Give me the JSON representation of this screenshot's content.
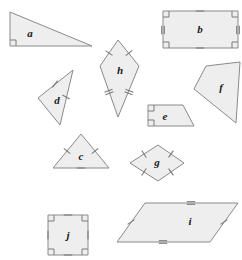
{
  "figure": {
    "width": 242,
    "height": 260,
    "background_color": "#ffffff",
    "shape_fill_color": "#eeeeee",
    "shape_stroke_color": "#8a8a8a",
    "mark_color": "#7a7a7a",
    "label_color": "#1a1a1a"
  },
  "shapes": [
    {
      "id": "a",
      "label": "a",
      "kind": "right-triangle",
      "points": "10,12 10,46 92,46",
      "label_x": 30,
      "label_y": 34,
      "right_angles": [
        {
          "x": 10,
          "y": 46,
          "dx": 1,
          "dy": -1
        }
      ],
      "ticks": []
    },
    {
      "id": "b",
      "label": "b",
      "kind": "rectangle",
      "points": "163,11 238,11 238,48 163,48",
      "label_x": 200,
      "label_y": 30,
      "right_angles": [
        {
          "x": 163,
          "y": 11,
          "dx": 1,
          "dy": 1
        },
        {
          "x": 238,
          "y": 11,
          "dx": -1,
          "dy": 1
        },
        {
          "x": 238,
          "y": 48,
          "dx": -1,
          "dy": -1
        },
        {
          "x": 163,
          "y": 48,
          "dx": 1,
          "dy": -1
        }
      ],
      "ticks": [
        {
          "x": 200,
          "y": 11,
          "angle": 90,
          "count": 1
        },
        {
          "x": 200,
          "y": 48,
          "angle": 90,
          "count": 1
        },
        {
          "x": 163,
          "y": 30,
          "angle": 0,
          "count": 2
        },
        {
          "x": 238,
          "y": 30,
          "angle": 0,
          "count": 2
        }
      ]
    },
    {
      "id": "c",
      "label": "c",
      "kind": "equilateral-triangle",
      "points": "81,134 109,168 53,168",
      "label_x": 81,
      "label_y": 157,
      "right_angles": [],
      "ticks": [
        {
          "x": 95,
          "y": 151,
          "angle": 50,
          "count": 1
        },
        {
          "x": 67,
          "y": 151,
          "angle": -50,
          "count": 1
        },
        {
          "x": 81,
          "y": 168,
          "angle": 90,
          "count": 1
        }
      ]
    },
    {
      "id": "d",
      "label": "d",
      "kind": "isosceles-triangle",
      "points": "73,70 38,98 60,125",
      "label_x": 57,
      "label_y": 101,
      "right_angles": [],
      "ticks": [
        {
          "x": 55,
          "y": 84,
          "angle": 38,
          "count": 1
        },
        {
          "x": 66,
          "y": 97,
          "angle": -60,
          "count": 1
        }
      ]
    },
    {
      "id": "e",
      "label": "e",
      "kind": "right-trapezoid",
      "points": "148,105 183,105 194,126 148,126",
      "label_x": 165,
      "label_y": 117,
      "right_angles": [
        {
          "x": 148,
          "y": 105,
          "dx": 1,
          "dy": 1
        },
        {
          "x": 148,
          "y": 126,
          "dx": 1,
          "dy": -1
        }
      ],
      "ticks": []
    },
    {
      "id": "f",
      "label": "f",
      "kind": "irregular-quadrilateral",
      "points": "206,66 240,62 236,123 194,89",
      "label_x": 221,
      "label_y": 88,
      "right_angles": [],
      "ticks": []
    },
    {
      "id": "g",
      "label": "g",
      "kind": "rhombus",
      "points": "158,145 184,163 158,181 130,163",
      "label_x": 157,
      "label_y": 163,
      "right_angles": [],
      "ticks": [
        {
          "x": 171,
          "y": 154,
          "angle": 35,
          "count": 1
        },
        {
          "x": 171,
          "y": 172,
          "angle": -35,
          "count": 1
        },
        {
          "x": 144,
          "y": 154,
          "angle": -33,
          "count": 1
        },
        {
          "x": 144,
          "y": 172,
          "angle": 33,
          "count": 1
        }
      ]
    },
    {
      "id": "h",
      "label": "h",
      "kind": "kite",
      "points": "118,40 139,66 118,117 100,66",
      "label_x": 120,
      "label_y": 71,
      "right_angles": [],
      "ticks": [
        {
          "x": 129,
          "y": 53,
          "angle": 52,
          "count": 1
        },
        {
          "x": 109,
          "y": 53,
          "angle": -55,
          "count": 1
        },
        {
          "x": 129,
          "y": 92,
          "angle": -70,
          "count": 2
        },
        {
          "x": 109,
          "y": 92,
          "angle": 70,
          "count": 2
        }
      ]
    },
    {
      "id": "i",
      "label": "i",
      "kind": "parallelogram",
      "points": "145,203 238,203 210,242 117,242",
      "label_x": 190,
      "label_y": 222,
      "right_angles": [],
      "ticks": [
        {
          "x": 191,
          "y": 203,
          "angle": 90,
          "count": 2
        },
        {
          "x": 163,
          "y": 242,
          "angle": 90,
          "count": 2
        },
        {
          "x": 131,
          "y": 222,
          "angle": 55,
          "count": 1
        },
        {
          "x": 224,
          "y": 222,
          "angle": 55,
          "count": 1
        }
      ]
    },
    {
      "id": "j",
      "label": "j",
      "kind": "square",
      "points": "48,215 88,215 88,255 48,255",
      "label_x": 68,
      "label_y": 236,
      "right_angles": [
        {
          "x": 48,
          "y": 215,
          "dx": 1,
          "dy": 1
        },
        {
          "x": 88,
          "y": 215,
          "dx": -1,
          "dy": 1
        },
        {
          "x": 88,
          "y": 255,
          "dx": -1,
          "dy": -1
        },
        {
          "x": 48,
          "y": 255,
          "dx": 1,
          "dy": -1
        }
      ],
      "ticks": [
        {
          "x": 68,
          "y": 215,
          "angle": 90,
          "count": 1
        },
        {
          "x": 68,
          "y": 255,
          "angle": 90,
          "count": 1
        },
        {
          "x": 48,
          "y": 235,
          "angle": 0,
          "count": 1
        },
        {
          "x": 88,
          "y": 235,
          "angle": 0,
          "count": 1
        }
      ]
    }
  ]
}
